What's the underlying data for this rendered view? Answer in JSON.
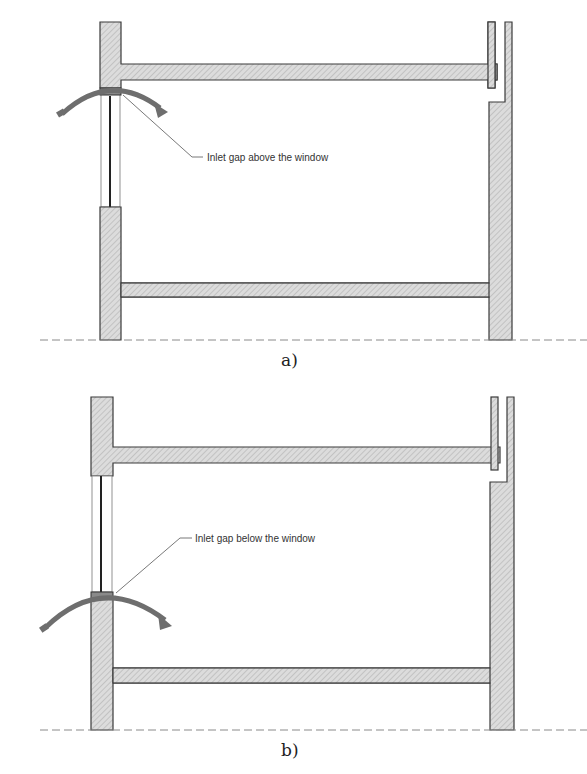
{
  "figure": {
    "panels": [
      {
        "id": "a",
        "caption": "a)",
        "annotation": "Inlet gap above the window",
        "gap_position": "above"
      },
      {
        "id": "b",
        "caption": "b)",
        "annotation": "Inlet gap below the window",
        "gap_position": "below"
      }
    ],
    "colors": {
      "wall_fill": "#d9d9d9",
      "wall_stroke": "#3a3a3a",
      "hatch": "#9a9a9a",
      "arrow": "#6e6e6e",
      "ground_line": "#8a8a8a"
    }
  }
}
